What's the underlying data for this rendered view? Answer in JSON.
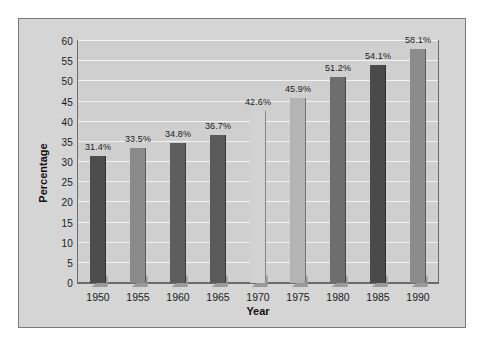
{
  "chart_data": {
    "type": "bar",
    "title": "",
    "xlabel": "Year",
    "ylabel": "Percentage",
    "categories": [
      "1950",
      "1955",
      "1960",
      "1965",
      "1970",
      "1975",
      "1980",
      "1985",
      "1990"
    ],
    "values": [
      31.4,
      33.5,
      34.8,
      36.7,
      42.6,
      45.9,
      51.2,
      54.1,
      58.1
    ],
    "data_labels": [
      "31.4%",
      "33.5%",
      "34.8%",
      "36.7%",
      "42.6%",
      "45.9%",
      "51.2%",
      "54.1%",
      "58.1%"
    ],
    "bar_colors": [
      "#4d4d4d",
      "#8a8a8a",
      "#5e5e5e",
      "#5a5a5a",
      "#d2d2d2",
      "#b4b4b4",
      "#6e6e6e",
      "#4a4a4a",
      "#8c8c8c"
    ],
    "ylim": [
      0,
      60
    ],
    "yticks": [
      0,
      5,
      10,
      15,
      20,
      25,
      30,
      35,
      40,
      45,
      50,
      55,
      60
    ],
    "ytick_labels": [
      "0",
      "5",
      "10",
      "15",
      "20",
      "25",
      "30",
      "35",
      "40",
      "45",
      "50",
      "55",
      "60"
    ],
    "grid": true,
    "grid_orientation": "horizontal",
    "legend": false,
    "plot_background": "#cfcfcf",
    "panel_background": "#d5d5d5",
    "gridline_color": "#f2f2f2",
    "axis_color": "#6b6b6b",
    "text_color": "#1a1a1a"
  }
}
